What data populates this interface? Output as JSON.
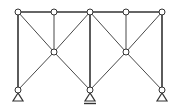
{
  "diagram": {
    "type": "truss-frame",
    "colors": {
      "member": "#333333",
      "node_fill": "#ffffff",
      "node_stroke": "#333333",
      "background": "#ffffff"
    },
    "nodes": [
      {
        "id": "T1",
        "x": 18,
        "y": 12
      },
      {
        "id": "T2",
        "x": 54,
        "y": 12
      },
      {
        "id": "T3",
        "x": 90,
        "y": 12
      },
      {
        "id": "T4",
        "x": 126,
        "y": 12
      },
      {
        "id": "T5",
        "x": 162,
        "y": 12
      },
      {
        "id": "M1",
        "x": 54,
        "y": 52
      },
      {
        "id": "M2",
        "x": 126,
        "y": 52
      },
      {
        "id": "B1",
        "x": 18,
        "y": 90
      },
      {
        "id": "B2",
        "x": 90,
        "y": 90
      },
      {
        "id": "B3",
        "x": 162,
        "y": 90
      }
    ],
    "members": [
      {
        "from": "T1",
        "to": "T2",
        "weight": "heavy"
      },
      {
        "from": "T2",
        "to": "T3",
        "weight": "heavy"
      },
      {
        "from": "T3",
        "to": "T4",
        "weight": "heavy"
      },
      {
        "from": "T4",
        "to": "T5",
        "weight": "heavy"
      },
      {
        "from": "T1",
        "to": "B1",
        "weight": "heavy"
      },
      {
        "from": "T3",
        "to": "B2",
        "weight": "heavy"
      },
      {
        "from": "T5",
        "to": "B3",
        "weight": "heavy"
      },
      {
        "from": "T2",
        "to": "M1",
        "weight": "light"
      },
      {
        "from": "T4",
        "to": "M2",
        "weight": "light"
      },
      {
        "from": "T1",
        "to": "M1",
        "weight": "light"
      },
      {
        "from": "T3",
        "to": "M1",
        "weight": "light"
      },
      {
        "from": "M1",
        "to": "B1",
        "weight": "light"
      },
      {
        "from": "M1",
        "to": "B2",
        "weight": "light"
      },
      {
        "from": "T3",
        "to": "M2",
        "weight": "light"
      },
      {
        "from": "T5",
        "to": "M2",
        "weight": "light"
      },
      {
        "from": "M2",
        "to": "B2",
        "weight": "light"
      },
      {
        "from": "M2",
        "to": "B3",
        "weight": "light"
      }
    ],
    "supports": [
      {
        "node": "B1",
        "type": "pin"
      },
      {
        "node": "B2",
        "type": "pin-fixed-ground"
      },
      {
        "node": "B3",
        "type": "pin"
      }
    ]
  }
}
